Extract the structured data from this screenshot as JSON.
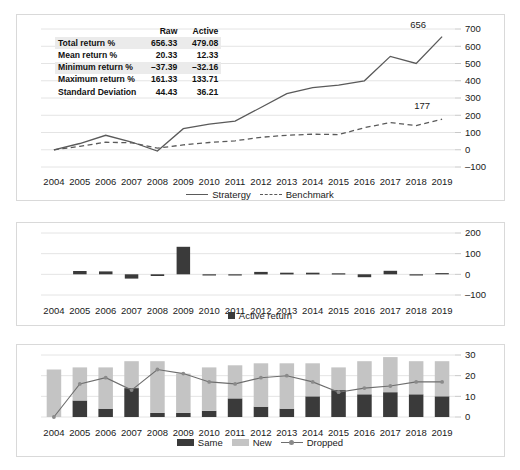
{
  "stats_table": {
    "headers": [
      "",
      "Raw",
      "Active"
    ],
    "rows": [
      {
        "label": "Total return %",
        "raw": "656.33",
        "active": "479.08",
        "shaded": true
      },
      {
        "label": "Mean return %",
        "raw": "20.33",
        "active": "12.33",
        "shaded": false
      },
      {
        "label": "Minimum return %",
        "raw": "–37.39",
        "active": "–32.16",
        "shaded": true
      },
      {
        "label": "Maximum return %",
        "raw": "161.33",
        "active": "133.71",
        "shaded": false
      },
      {
        "label": "Standard Deviation",
        "raw": "44.43",
        "active": "36.21",
        "shaded": false
      }
    ]
  },
  "colors": {
    "series_dark": "#5a5a5a",
    "bar_dark": "#3a3a3a",
    "bar_light": "#c4c4c4",
    "gridline": "#e4e4e4",
    "panel_border": "#d9d9d9"
  },
  "legends": {
    "chart1": [
      {
        "label": "Stratergy",
        "style": "solid-line"
      },
      {
        "label": "Benchmark",
        "style": "dashed-line"
      }
    ],
    "chart2": [
      {
        "label": "Active return",
        "style": "dark-square"
      }
    ],
    "chart3": [
      {
        "label": "Same",
        "style": "dark-rect"
      },
      {
        "label": "New",
        "style": "light-rect"
      },
      {
        "label": "Dropped",
        "style": "line-marker"
      }
    ]
  },
  "chart_data": [
    {
      "type": "line",
      "title": "",
      "xlabel": "",
      "ylabel": "",
      "categories": [
        "2004",
        "2005",
        "2006",
        "2007",
        "2008",
        "2009",
        "2010",
        "2011",
        "2012",
        "2013",
        "2014",
        "2015",
        "2016",
        "2017",
        "2018",
        "2019"
      ],
      "ylim": [
        -100,
        700
      ],
      "yticks": [
        -100,
        0,
        100,
        200,
        300,
        400,
        500,
        600,
        700
      ],
      "grid": true,
      "legend_position": "bottom",
      "annotations": [
        {
          "text": "656",
          "series": "Stratergy",
          "x": "2019",
          "value": 656
        },
        {
          "text": "177",
          "series": "Benchmark",
          "x": "2019",
          "value": 177
        }
      ],
      "series": [
        {
          "name": "Stratergy",
          "style": "solid",
          "values": [
            0,
            36,
            84,
            45,
            -8,
            122,
            148,
            166,
            245,
            325,
            360,
            374,
            400,
            541,
            500,
            656
          ]
        },
        {
          "name": "Benchmark",
          "style": "dashed",
          "values": [
            0,
            20,
            44,
            40,
            9,
            28,
            42,
            52,
            72,
            84,
            90,
            88,
            128,
            158,
            140,
            177
          ]
        }
      ]
    },
    {
      "type": "bar",
      "title": "",
      "xlabel": "",
      "ylabel": "",
      "categories": [
        "2004",
        "2005",
        "2006",
        "2007",
        "2008",
        "2009",
        "2010",
        "2011",
        "2012",
        "2013",
        "2014",
        "2015",
        "2016",
        "2017",
        "2018",
        "2019"
      ],
      "ylim": [
        -100,
        200
      ],
      "yticks": [
        -100,
        0,
        100,
        200
      ],
      "grid": true,
      "legend_position": "bottom",
      "series": [
        {
          "name": "Active return",
          "values": [
            0,
            16,
            14,
            -21,
            -8,
            133,
            -3,
            -5,
            12,
            8,
            8,
            5,
            -14,
            17,
            -2,
            6
          ]
        }
      ]
    },
    {
      "type": "bar",
      "stacked": true,
      "title": "",
      "xlabel": "",
      "ylabel": "",
      "categories": [
        "2004",
        "2005",
        "2006",
        "2007",
        "2008",
        "2009",
        "2010",
        "2011",
        "2012",
        "2013",
        "2014",
        "2015",
        "2016",
        "2017",
        "2018",
        "2019"
      ],
      "ylim": [
        0,
        30
      ],
      "yticks": [
        0,
        10,
        20,
        30
      ],
      "grid": true,
      "legend_position": "bottom",
      "series": [
        {
          "name": "Same",
          "type": "bar",
          "values": [
            0,
            8,
            4,
            14,
            2,
            2,
            3,
            9,
            5,
            4,
            10,
            13,
            11,
            12,
            11,
            10
          ]
        },
        {
          "name": "New",
          "type": "bar",
          "values": [
            23,
            16,
            20,
            13,
            25,
            19,
            21,
            16,
            21,
            22,
            16,
            11,
            16,
            17,
            16,
            17
          ]
        },
        {
          "name": "Dropped",
          "type": "line",
          "values": [
            0,
            16,
            19,
            13,
            23,
            21,
            17,
            16,
            19,
            20,
            17,
            12,
            14,
            15,
            17,
            17
          ]
        }
      ]
    }
  ]
}
